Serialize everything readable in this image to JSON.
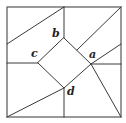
{
  "diagram": {
    "colors": {
      "line": "#3a3a3a",
      "border": "#555555",
      "label": "#222222",
      "background": "#ffffff"
    },
    "outer_square": {
      "x": 7,
      "y": 7,
      "size": 114
    },
    "points": {
      "a": {
        "x": 91,
        "y": 64
      },
      "b": {
        "x": 64,
        "y": 38
      },
      "c": {
        "x": 38,
        "y": 63
      },
      "d": {
        "x": 64,
        "y": 88
      }
    },
    "labels": {
      "a": {
        "text": "a",
        "x": 89,
        "y": 58
      },
      "b": {
        "text": "b",
        "x": 52,
        "y": 37
      },
      "c": {
        "text": "c",
        "x": 31,
        "y": 57
      },
      "d": {
        "text": "d",
        "x": 67,
        "y": 95
      }
    }
  }
}
